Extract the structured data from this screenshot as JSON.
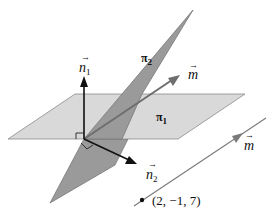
{
  "diagram": {
    "planes": [
      {
        "name": "pi1",
        "label_main": "π",
        "label_sub": "1",
        "fill": "#d9d9d9"
      },
      {
        "name": "pi2",
        "label_main": "π",
        "label_sub": "2",
        "fill": "#9a9a9a"
      }
    ],
    "vectors": [
      {
        "name": "n1",
        "label_main": "n",
        "label_sub": "1",
        "arrow": "→"
      },
      {
        "name": "n2",
        "label_main": "n",
        "label_sub": "2",
        "arrow": "→"
      },
      {
        "name": "m_on_plane",
        "label_main": "m",
        "arrow": "→"
      },
      {
        "name": "m_on_line",
        "label_main": "m",
        "arrow": "→"
      }
    ],
    "point": {
      "label": "(2, −1, 7)"
    },
    "colors": {
      "plane_light": "#d9d9d9",
      "plane_dark": "#9a9a9a",
      "edge": "#6e6e6e",
      "line": "#7a7a7a",
      "arrow": "#111111"
    }
  }
}
